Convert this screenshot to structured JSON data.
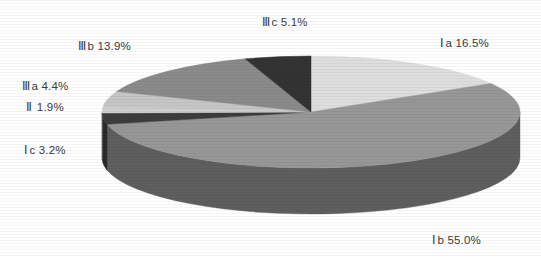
{
  "chart_data": {
    "type": "pie",
    "title": "",
    "subtitle": "",
    "xlabel": "",
    "ylabel": "",
    "legend_position": "none",
    "grid": false,
    "three_d": true,
    "start_angle_deg": 0,
    "direction": "clockwise",
    "categories": [
      "Ⅲc",
      "Ⅰa",
      "Ⅰb",
      "Ⅰc",
      "Ⅱ",
      "Ⅲa",
      "Ⅲb"
    ],
    "values": [
      5.1,
      16.5,
      55.0,
      3.2,
      1.9,
      4.4,
      13.9
    ],
    "unit": "%",
    "total": 100.0,
    "slices": [
      {
        "id": "Ia",
        "roman": "Ⅰ",
        "suffix": "a",
        "label": "Ⅰa  16.5%",
        "value": 16.5,
        "top_color": "#dedede",
        "side_color": "#b4b4b4",
        "order": 1
      },
      {
        "id": "Ib",
        "roman": "Ⅰ",
        "suffix": "b",
        "label": "Ⅰb  55.0%",
        "value": 55.0,
        "top_color": "#979797",
        "side_color": "#5e5e5e",
        "order": 2
      },
      {
        "id": "Ic",
        "roman": "Ⅰ",
        "suffix": "c",
        "label": "Ⅰc  3.2%",
        "value": 3.2,
        "top_color": "#3d3d3d",
        "side_color": "#2b2b2b",
        "order": 3
      },
      {
        "id": "II",
        "roman": "Ⅱ",
        "suffix": "",
        "label": "Ⅱ  1.9%",
        "value": 1.9,
        "top_color": "#cfcfcf",
        "side_color": "#9a9a9a",
        "order": 4
      },
      {
        "id": "IIIa",
        "roman": "Ⅲ",
        "suffix": "a",
        "label": "Ⅲa  4.4%",
        "value": 4.4,
        "top_color": "#c6c6c6",
        "side_color": "#8f8f8f",
        "order": 5
      },
      {
        "id": "IIIb",
        "roman": "Ⅲ",
        "suffix": "b",
        "label": "Ⅲb  13.9%",
        "value": 13.9,
        "top_color": "#8a8a8a",
        "side_color": "#5a5a5a",
        "order": 6
      },
      {
        "id": "IIIc",
        "roman": "Ⅲ",
        "suffix": "c",
        "label": "Ⅲc  5.1%",
        "value": 5.1,
        "top_color": "#333333",
        "side_color": "#242424",
        "order": 7
      }
    ],
    "geometry": {
      "cx": 311,
      "cy": 112,
      "rx": 209,
      "ry": 56,
      "depth": 46
    },
    "background_color": "#ffffff",
    "label_color": "#3a3a3a"
  },
  "labels": {
    "Ia": {
      "roman": "Ⅰ",
      "text": "a  16.5%"
    },
    "Ib": {
      "roman": "Ⅰ",
      "text": "b  55.0%"
    },
    "Ic": {
      "roman": "Ⅰ",
      "text": "c  3.2%"
    },
    "II": {
      "roman": "Ⅱ",
      "text": "  1.9%"
    },
    "IIIa": {
      "roman": "Ⅲ",
      "text": "a  4.4%"
    },
    "IIIb": {
      "roman": "Ⅲ",
      "text": "b  13.9%"
    },
    "IIIc": {
      "roman": "Ⅲ",
      "text": "c  5.1%"
    }
  }
}
